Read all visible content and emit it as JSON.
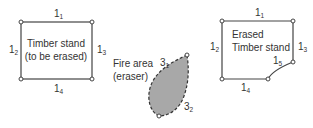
{
  "diagram": {
    "left_panel": {
      "title_line1": "Timber stand",
      "title_line2": "(to be erased)",
      "edges": {
        "top": {
          "base": "1",
          "sub": "1"
        },
        "left": {
          "base": "1",
          "sub": "2"
        },
        "right": {
          "base": "1",
          "sub": "3"
        },
        "bottom": {
          "base": "1",
          "sub": "4"
        }
      }
    },
    "middle_panel": {
      "title_line1": "Fire area",
      "title_line2": "(eraser)",
      "edges": {
        "upper": {
          "base": "3",
          "sub": "1"
        },
        "lower": {
          "base": "3",
          "sub": "2"
        }
      },
      "fill_color": "#a8a8a8"
    },
    "right_panel": {
      "title_line1": "Erased",
      "title_line2": "Timber stand",
      "edges": {
        "top": {
          "base": "1",
          "sub": "1"
        },
        "left": {
          "base": "1",
          "sub": "2"
        },
        "right": {
          "base": "1",
          "sub": "3"
        },
        "bottom": {
          "base": "1",
          "sub": "4"
        },
        "notch": {
          "base": "1",
          "sub": "5"
        }
      }
    },
    "line_color": "#444444"
  }
}
